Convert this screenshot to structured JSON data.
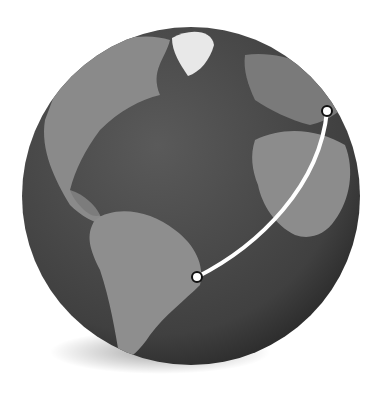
{
  "map": {
    "type": "globe",
    "view": "Atlantic Ocean hemisphere (Americas, Europe, Africa)",
    "colors": {
      "ocean": "#4a4a4a",
      "land": "#8c8c8c",
      "ice": "#f2f2f2",
      "route": "#ffffff",
      "marker_stroke": "#111111"
    },
    "route": {
      "from": {
        "name": "Brazil (east coast)",
        "x": 197,
        "y": 277
      },
      "to": {
        "name": "Europe",
        "x": 327,
        "y": 111
      }
    }
  }
}
